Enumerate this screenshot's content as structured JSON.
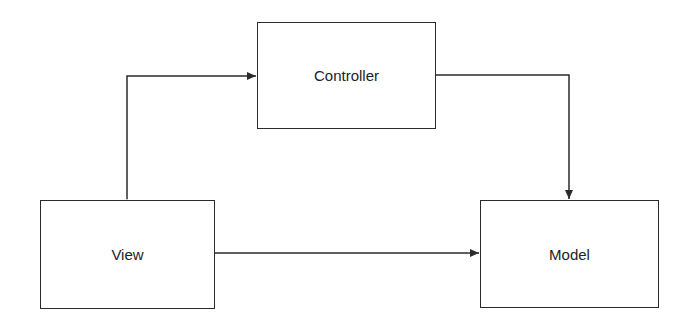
{
  "diagram": {
    "type": "flowchart",
    "colors": {
      "stroke": "#2b2b2b",
      "text": "#222222",
      "background": "#ffffff"
    },
    "nodes": {
      "controller": {
        "label": "Controller"
      },
      "view": {
        "label": "View"
      },
      "model": {
        "label": "Model"
      }
    },
    "edges": [
      {
        "from": "view",
        "to": "controller",
        "bidirectional": true
      },
      {
        "from": "controller",
        "to": "model",
        "bidirectional": false
      },
      {
        "from": "view",
        "to": "model",
        "bidirectional": false
      }
    ]
  }
}
